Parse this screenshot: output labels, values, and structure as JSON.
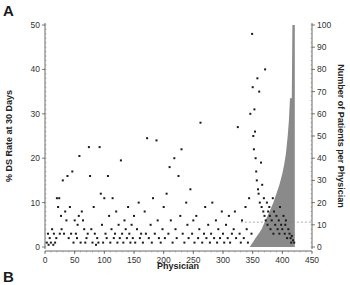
{
  "panels": {
    "a_label": "A",
    "b_label": "B"
  },
  "chart_data": {
    "type": "scatter",
    "title": "",
    "xlabel": "Physician",
    "ylabel": "% DS Rate at 30 Days",
    "y2label": "Number of Patients per Physician",
    "xlim": [
      0,
      450
    ],
    "ylim": [
      0,
      50
    ],
    "y2lim": [
      0,
      100
    ],
    "x_ticks": [
      0,
      50,
      100,
      150,
      200,
      250,
      300,
      350,
      400,
      450
    ],
    "y_ticks": [
      0,
      10,
      20,
      30,
      40,
      50
    ],
    "y2_ticks": [
      0,
      10,
      20,
      30,
      40,
      50,
      60,
      70,
      80,
      90,
      100
    ],
    "grid": false,
    "mean_line": {
      "y": 5.6,
      "style": "dashed"
    },
    "series": [
      {
        "name": "DS rate per physician",
        "kind": "scatter",
        "axis": "left",
        "points": [
          [
            3,
            1
          ],
          [
            5,
            3
          ],
          [
            6,
            0.5
          ],
          [
            8,
            2
          ],
          [
            10,
            1
          ],
          [
            12,
            4
          ],
          [
            14,
            0.5
          ],
          [
            15,
            3
          ],
          [
            17,
            1
          ],
          [
            19,
            2
          ],
          [
            20,
            11
          ],
          [
            22,
            9
          ],
          [
            24,
            11
          ],
          [
            25,
            3
          ],
          [
            27,
            7
          ],
          [
            28,
            4
          ],
          [
            30,
            15
          ],
          [
            32,
            3
          ],
          [
            34,
            8
          ],
          [
            36,
            6
          ],
          [
            38,
            16
          ],
          [
            40,
            2
          ],
          [
            42,
            9
          ],
          [
            44,
            3
          ],
          [
            46,
            17
          ],
          [
            48,
            1
          ],
          [
            50,
            6
          ],
          [
            52,
            3
          ],
          [
            54,
            2
          ],
          [
            55,
            5
          ],
          [
            57,
            7
          ],
          [
            58,
            20.5
          ],
          [
            60,
            1
          ],
          [
            62,
            8
          ],
          [
            64,
            6
          ],
          [
            66,
            4
          ],
          [
            68,
            1
          ],
          [
            70,
            2
          ],
          [
            72,
            3
          ],
          [
            74,
            22.5
          ],
          [
            76,
            16
          ],
          [
            78,
            4
          ],
          [
            80,
            1
          ],
          [
            82,
            9
          ],
          [
            84,
            3
          ],
          [
            86,
            0.5
          ],
          [
            88,
            2
          ],
          [
            90,
            1
          ],
          [
            92,
            22.5
          ],
          [
            94,
            12
          ],
          [
            96,
            5
          ],
          [
            98,
            1
          ],
          [
            100,
            11
          ],
          [
            102,
            3
          ],
          [
            104,
            2
          ],
          [
            106,
            16
          ],
          [
            108,
            7
          ],
          [
            110,
            1
          ],
          [
            112,
            4
          ],
          [
            114,
            11
          ],
          [
            116,
            2
          ],
          [
            118,
            3
          ],
          [
            120,
            8
          ],
          [
            122,
            1
          ],
          [
            124,
            5
          ],
          [
            126,
            2
          ],
          [
            128,
            19.5
          ],
          [
            130,
            3
          ],
          [
            132,
            1
          ],
          [
            134,
            6
          ],
          [
            136,
            4
          ],
          [
            138,
            2
          ],
          [
            140,
            9
          ],
          [
            142,
            3
          ],
          [
            144,
            1
          ],
          [
            146,
            5
          ],
          [
            148,
            2
          ],
          [
            150,
            7
          ],
          [
            152,
            1
          ],
          [
            155,
            4
          ],
          [
            158,
            10
          ],
          [
            160,
            2
          ],
          [
            162,
            3
          ],
          [
            165,
            1
          ],
          [
            168,
            8
          ],
          [
            170,
            3
          ],
          [
            172,
            24.5
          ],
          [
            175,
            2
          ],
          [
            178,
            5
          ],
          [
            180,
            1
          ],
          [
            182,
            11
          ],
          [
            185,
            3
          ],
          [
            188,
            24
          ],
          [
            190,
            6
          ],
          [
            192,
            2
          ],
          [
            195,
            1
          ],
          [
            198,
            4
          ],
          [
            200,
            9
          ],
          [
            202,
            2
          ],
          [
            205,
            12
          ],
          [
            208,
            3
          ],
          [
            210,
            18
          ],
          [
            212,
            6
          ],
          [
            215,
            1
          ],
          [
            218,
            20
          ],
          [
            220,
            4
          ],
          [
            222,
            2
          ],
          [
            225,
            16
          ],
          [
            228,
            7
          ],
          [
            230,
            22
          ],
          [
            232,
            3
          ],
          [
            235,
            1
          ],
          [
            238,
            10
          ],
          [
            240,
            5
          ],
          [
            242,
            2
          ],
          [
            245,
            13
          ],
          [
            248,
            3
          ],
          [
            250,
            6
          ],
          [
            252,
            1
          ],
          [
            255,
            7
          ],
          [
            258,
            2
          ],
          [
            260,
            4
          ],
          [
            262,
            28
          ],
          [
            265,
            1
          ],
          [
            268,
            3
          ],
          [
            270,
            9
          ],
          [
            272,
            2
          ],
          [
            275,
            5
          ],
          [
            278,
            1
          ],
          [
            280,
            3
          ],
          [
            282,
            10
          ],
          [
            285,
            2
          ],
          [
            288,
            6
          ],
          [
            290,
            1
          ],
          [
            292,
            4
          ],
          [
            295,
            2
          ],
          [
            298,
            8
          ],
          [
            300,
            3
          ],
          [
            302,
            1
          ],
          [
            305,
            5
          ],
          [
            308,
            2
          ],
          [
            310,
            7
          ],
          [
            312,
            1
          ],
          [
            315,
            3
          ],
          [
            318,
            4
          ],
          [
            320,
            8
          ],
          [
            322,
            2
          ],
          [
            325,
            27
          ],
          [
            328,
            3
          ],
          [
            330,
            1
          ],
          [
            332,
            6
          ],
          [
            335,
            2
          ],
          [
            338,
            9
          ],
          [
            340,
            4
          ],
          [
            342,
            1
          ],
          [
            344,
            11
          ],
          [
            346,
            30
          ],
          [
            348,
            3
          ],
          [
            349,
            48
          ],
          [
            350,
            36
          ],
          [
            351,
            25
          ],
          [
            352,
            22
          ],
          [
            353,
            31
          ],
          [
            354,
            26
          ],
          [
            355,
            20
          ],
          [
            356,
            17
          ],
          [
            357,
            15
          ],
          [
            358,
            38
          ],
          [
            359,
            13
          ],
          [
            360,
            12
          ],
          [
            361,
            35
          ],
          [
            362,
            10
          ],
          [
            364,
            19
          ],
          [
            365,
            9
          ],
          [
            366,
            14
          ],
          [
            368,
            8
          ],
          [
            369,
            11
          ],
          [
            370,
            7
          ],
          [
            371,
            40
          ],
          [
            372,
            6
          ],
          [
            374,
            10
          ],
          [
            375,
            5
          ],
          [
            376,
            8
          ],
          [
            378,
            9
          ],
          [
            379,
            7
          ],
          [
            380,
            4
          ],
          [
            382,
            6
          ],
          [
            384,
            11
          ],
          [
            385,
            3
          ],
          [
            386,
            8
          ],
          [
            388,
            5
          ],
          [
            390,
            7
          ],
          [
            392,
            4
          ],
          [
            394,
            6
          ],
          [
            395,
            3
          ],
          [
            396,
            9
          ],
          [
            398,
            5
          ],
          [
            400,
            4
          ],
          [
            402,
            7
          ],
          [
            404,
            3
          ],
          [
            405,
            5
          ],
          [
            406,
            6
          ],
          [
            408,
            2
          ],
          [
            410,
            4
          ],
          [
            412,
            3
          ],
          [
            414,
            2
          ],
          [
            415,
            1
          ],
          [
            416,
            2.5
          ],
          [
            418,
            1.5
          ],
          [
            420,
            1
          ]
        ]
      },
      {
        "name": "Number of patients per physician",
        "kind": "area",
        "axis": "right",
        "points": [
          [
            345,
            0
          ],
          [
            350,
            2
          ],
          [
            355,
            4
          ],
          [
            360,
            6
          ],
          [
            365,
            8
          ],
          [
            370,
            11
          ],
          [
            375,
            14
          ],
          [
            380,
            17
          ],
          [
            385,
            20
          ],
          [
            390,
            24
          ],
          [
            395,
            28
          ],
          [
            400,
            33
          ],
          [
            403,
            37
          ],
          [
            406,
            42
          ],
          [
            409,
            50
          ],
          [
            411,
            57
          ],
          [
            413,
            67
          ],
          [
            416,
            67
          ],
          [
            417,
            100
          ],
          [
            421,
            100
          ],
          [
            421,
            0
          ]
        ]
      }
    ]
  }
}
